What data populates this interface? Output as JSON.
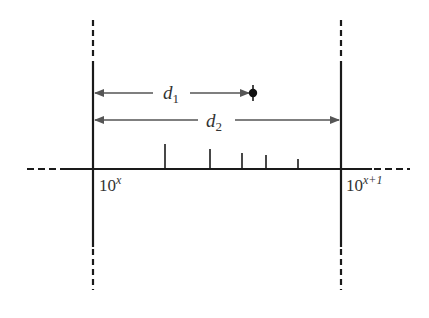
{
  "diagram": {
    "title": "",
    "labels": {
      "left_bound": {
        "base": "10",
        "exp": "x"
      },
      "right_bound": {
        "base": "10",
        "exp": "x+1"
      },
      "d1": {
        "main": "d",
        "sub": "1"
      },
      "d2": {
        "main": "d",
        "sub": "2"
      }
    },
    "colors": {
      "line": "#1a1a1a",
      "arrow": "#555555",
      "text": "#333333"
    },
    "geometry": {
      "axis_y": 169,
      "left_x": 93,
      "right_x": 341,
      "point_x": 253,
      "d1_y": 93,
      "d2_y": 120,
      "ticks": [
        {
          "x": 165,
          "top": 144
        },
        {
          "x": 210,
          "top": 149
        },
        {
          "x": 242,
          "top": 153
        },
        {
          "x": 266,
          "top": 155
        },
        {
          "x": 298,
          "top": 159
        }
      ]
    }
  }
}
